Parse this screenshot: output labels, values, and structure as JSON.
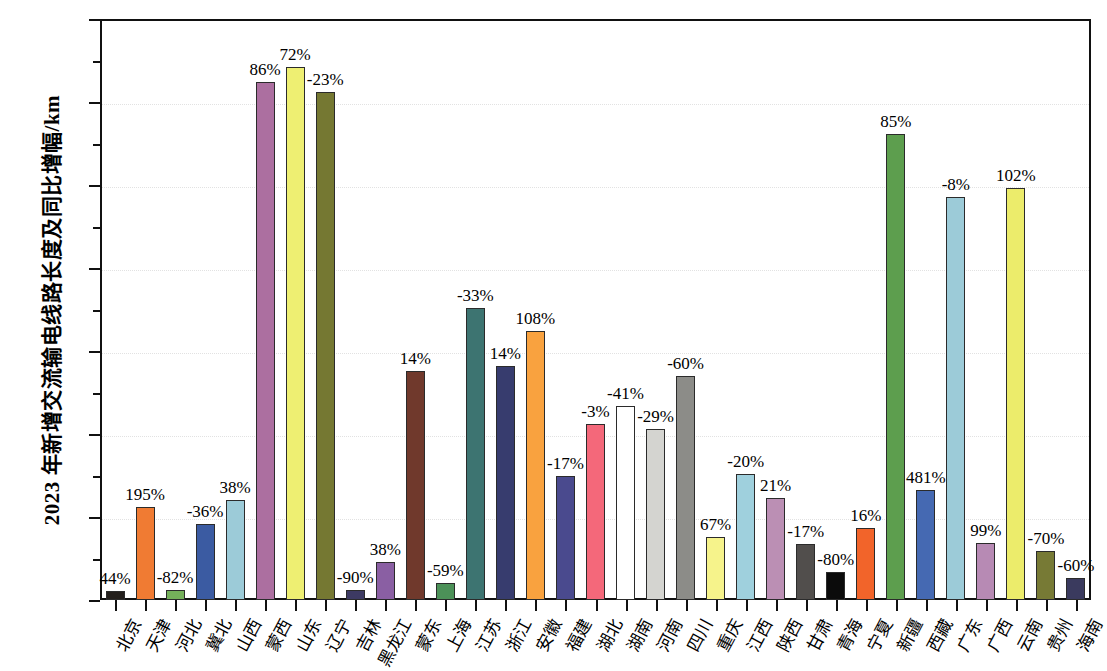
{
  "chart_data": {
    "type": "bar",
    "title": "",
    "xlabel": "",
    "ylabel": "2023 年新增交流输电线路长度及同比增幅/km",
    "ylim": [
      0,
      3500
    ],
    "ytick_values": [
      0,
      500,
      1000,
      1500,
      2000,
      2500,
      3000,
      3500
    ],
    "ytick_labels": [
      "0",
      "500",
      "1000",
      "1500",
      "2000",
      "2500",
      "3000",
      "3500"
    ],
    "grid": true,
    "legend": "none",
    "categories": [
      "北京",
      "天津",
      "河北",
      "冀北",
      "山西",
      "蒙西",
      "山东",
      "辽宁",
      "吉林",
      "黑龙江",
      "蒙东",
      "上海",
      "江苏",
      "浙江",
      "安徽",
      "福建",
      "湖北",
      "湖南",
      "河南",
      "四川",
      "重庆",
      "江西",
      "陕西",
      "甘肃",
      "青海",
      "宁夏",
      "新疆",
      "西藏",
      "广东",
      "广西",
      "云南",
      "贵州",
      "海南"
    ],
    "values": [
      55,
      560,
      60,
      460,
      605,
      3120,
      3210,
      3060,
      60,
      230,
      1380,
      105,
      1760,
      1410,
      1620,
      745,
      1060,
      1170,
      1030,
      1350,
      380,
      760,
      615,
      340,
      170,
      435,
      2805,
      660,
      2425,
      345,
      2480,
      295,
      130
    ],
    "data_labels": [
      "44%",
      "195%",
      "-82%",
      "-36%",
      "38%",
      "86%",
      "72%",
      "-23%",
      "-90%",
      "38%",
      "14%",
      "-59%",
      "-33%",
      "14%",
      "108%",
      "-17%",
      "-3%",
      "-41%",
      "-29%",
      "-60%",
      "67%",
      "-20%",
      "21%",
      "-17%",
      "-80%",
      "16%",
      "85%",
      "481%",
      "-8%",
      "99%",
      "102%",
      "-70%",
      "-60%"
    ],
    "colors": [
      "#231f1c",
      "#f07b33",
      "#74b05a",
      "#3b5ba2",
      "#9ccbd8",
      "#ac6fa0",
      "#eeef72",
      "#757832",
      "#3d3a63",
      "#8a5fa3",
      "#70392c",
      "#4c9158",
      "#3d7471",
      "#373c6e",
      "#f9a23f",
      "#4a4a8e",
      "#f4687a",
      "#ffffff",
      "#d4d4d0",
      "#8c8c88",
      "#f6f38b",
      "#9fd0dd",
      "#bb8fb4",
      "#514e4c",
      "#0b0b0b",
      "#f2642a",
      "#5d9e4e",
      "#4569b2",
      "#9ccbd8",
      "#b78ab4",
      "#ecec6b",
      "#777a35",
      "#3a3a5e"
    ]
  }
}
